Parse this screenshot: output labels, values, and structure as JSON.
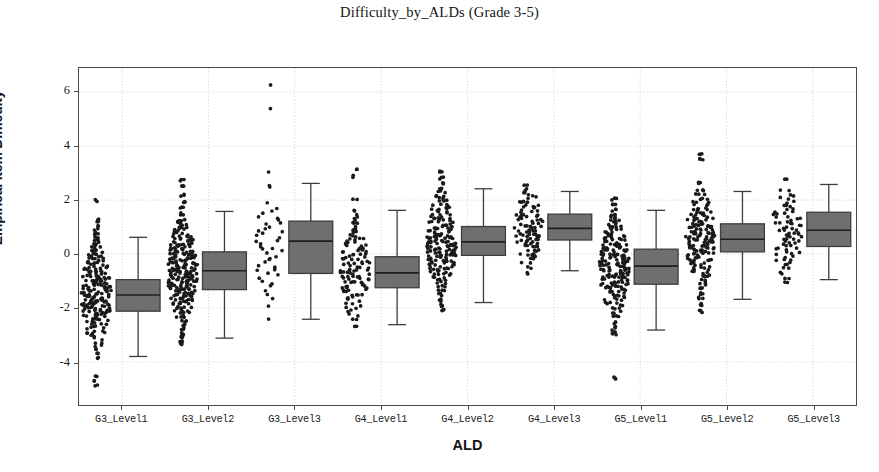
{
  "chart_data": {
    "type": "box",
    "title": "Difficulty_by_ALDs (Grade 3-5)",
    "xlabel": "ALD",
    "ylabel": "Empirical Item Difficulty",
    "categories": [
      "G3_Level1",
      "G3_Level2",
      "G3_Level3",
      "G4_Level1",
      "G4_Level2",
      "G4_Level3",
      "G5_Level1",
      "G5_Level2",
      "G5_Level3"
    ],
    "ylim": [
      -5.6,
      6.9
    ],
    "yticks": [
      -4,
      -2,
      0,
      2,
      4,
      6
    ],
    "ytick_labels": [
      "-4",
      "-2",
      "0",
      "2",
      "4",
      "6"
    ],
    "grid": true,
    "grid_style": "dotted",
    "legend": "none",
    "box_color": "#6f6f6f",
    "line_color": "#3d3d3d",
    "point_color": "#1a1a1a",
    "boxes": [
      {
        "category": "G3_Level1",
        "q1": -2.12,
        "median": -1.52,
        "q3": -0.95,
        "whisker_low": -3.8,
        "whisker_high": 0.62
      },
      {
        "category": "G3_Level2",
        "q1": -1.32,
        "median": -0.62,
        "q3": 0.08,
        "whisker_low": -3.12,
        "whisker_high": 1.58
      },
      {
        "category": "G3_Level3",
        "q1": -0.72,
        "median": 0.48,
        "q3": 1.22,
        "whisker_low": -2.42,
        "whisker_high": 2.62
      },
      {
        "category": "G4_Level1",
        "q1": -1.25,
        "median": -0.7,
        "q3": -0.1,
        "whisker_low": -2.62,
        "whisker_high": 1.62
      },
      {
        "category": "G4_Level2",
        "q1": -0.05,
        "median": 0.45,
        "q3": 1.02,
        "whisker_low": -1.8,
        "whisker_high": 2.42
      },
      {
        "category": "G4_Level3",
        "q1": 0.52,
        "median": 0.95,
        "q3": 1.48,
        "whisker_low": -0.62,
        "whisker_high": 2.32
      },
      {
        "category": "G5_Level1",
        "q1": -1.12,
        "median": -0.45,
        "q3": 0.18,
        "whisker_low": -2.82,
        "whisker_high": 1.62
      },
      {
        "category": "G5_Level2",
        "q1": 0.08,
        "median": 0.55,
        "q3": 1.12,
        "whisker_low": -1.68,
        "whisker_high": 2.32
      },
      {
        "category": "G5_Level3",
        "q1": 0.28,
        "median": 0.88,
        "q3": 1.55,
        "whisker_low": -0.95,
        "whisker_high": 2.58
      }
    ],
    "strips": [
      {
        "category": "G3_Level1",
        "n": 190,
        "center": -1.55,
        "spread": 0.95,
        "min": -4.95,
        "max": 2.0,
        "values": [
          2.0,
          1.28,
          1.18,
          1.05,
          0.92,
          0.78,
          0.7,
          0.62,
          0.55,
          0.48,
          0.4,
          0.35,
          0.3,
          0.22,
          0.15,
          0.1,
          0.05,
          0.0,
          -0.05,
          -0.1,
          -0.15,
          -0.2,
          -0.25,
          -0.3,
          -0.32,
          -0.36,
          -0.4,
          -0.44,
          -0.48,
          -0.52,
          -0.55,
          -0.58,
          -0.62,
          -0.65,
          -0.68,
          -0.72,
          -0.75,
          -0.78,
          -0.82,
          -0.85,
          -0.88,
          -0.92,
          -0.95,
          -0.98,
          -1.0,
          -1.02,
          -1.05,
          -1.08,
          -1.1,
          -1.12,
          -1.15,
          -1.18,
          -1.2,
          -1.22,
          -1.25,
          -1.28,
          -1.3,
          -1.32,
          -1.35,
          -1.38,
          -1.4,
          -1.42,
          -1.45,
          -1.48,
          -1.5,
          -1.52,
          -1.55,
          -1.58,
          -1.6,
          -1.62,
          -1.65,
          -1.68,
          -1.7,
          -1.72,
          -1.75,
          -1.78,
          -1.8,
          -1.82,
          -1.85,
          -1.88,
          -1.9,
          -1.92,
          -1.95,
          -1.98,
          -2.0,
          -2.02,
          -2.05,
          -2.08,
          -2.1,
          -2.12,
          -2.15,
          -2.18,
          -2.2,
          -2.22,
          -2.25,
          -2.28,
          -2.3,
          -2.35,
          -2.4,
          -2.45,
          -2.5,
          -2.55,
          -2.6,
          -2.65,
          -2.7,
          -2.75,
          -2.82,
          -2.9,
          -2.98,
          -3.05,
          -3.15,
          -3.28,
          -3.4,
          -3.55,
          -3.7,
          -3.85,
          -4.55,
          -4.72,
          -4.9
        ]
      },
      {
        "category": "G3_Level2",
        "n": 230,
        "center": -0.65,
        "spread": 0.95,
        "min": -3.35,
        "max": 2.72,
        "values": [
          2.72,
          2.48,
          2.18,
          1.92,
          1.7,
          1.48,
          1.28,
          1.18,
          1.08,
          0.98,
          0.9,
          0.82,
          0.75,
          0.68,
          0.62,
          0.55,
          0.5,
          0.45,
          0.4,
          0.35,
          0.3,
          0.25,
          0.22,
          0.18,
          0.14,
          0.1,
          0.06,
          0.02,
          -0.02,
          -0.06,
          -0.1,
          -0.14,
          -0.18,
          -0.22,
          -0.26,
          -0.3,
          -0.33,
          -0.36,
          -0.4,
          -0.43,
          -0.46,
          -0.5,
          -0.53,
          -0.56,
          -0.6,
          -0.63,
          -0.66,
          -0.7,
          -0.73,
          -0.76,
          -0.8,
          -0.83,
          -0.86,
          -0.9,
          -0.93,
          -0.96,
          -1.0,
          -1.03,
          -1.06,
          -1.1,
          -1.13,
          -1.16,
          -1.2,
          -1.23,
          -1.26,
          -1.3,
          -1.34,
          -1.38,
          -1.42,
          -1.46,
          -1.5,
          -1.55,
          -1.6,
          -1.65,
          -1.7,
          -1.76,
          -1.82,
          -1.88,
          -1.95,
          -2.02,
          -2.1,
          -2.18,
          -2.28,
          -2.38,
          -2.5,
          -2.62,
          -2.78,
          -2.95,
          -3.1,
          -3.22,
          -3.35
        ]
      },
      {
        "category": "G3_Level3",
        "n": 70,
        "center": 0.35,
        "spread": 1.1,
        "min": -2.38,
        "max": 6.32,
        "values": [
          6.32,
          5.38,
          3.0,
          2.58,
          2.45,
          1.88,
          1.72,
          1.6,
          1.5,
          1.42,
          1.35,
          1.28,
          1.2,
          1.12,
          1.05,
          0.98,
          0.9,
          0.82,
          0.75,
          0.68,
          0.6,
          0.52,
          0.45,
          0.38,
          0.3,
          0.22,
          0.15,
          0.08,
          0.0,
          -0.08,
          -0.16,
          -0.24,
          -0.32,
          -0.4,
          -0.48,
          -0.56,
          -0.64,
          -0.72,
          -0.8,
          -0.9,
          -1.0,
          -1.1,
          -1.22,
          -1.35,
          -1.5,
          -1.7,
          -1.92,
          -2.38
        ]
      },
      {
        "category": "G4_Level1",
        "n": 150,
        "center": -0.7,
        "spread": 0.85,
        "min": -2.72,
        "max": 3.18,
        "values": [
          3.18,
          2.88,
          2.02,
          1.58,
          1.42,
          1.3,
          1.2,
          1.1,
          1.0,
          0.92,
          0.84,
          0.76,
          0.68,
          0.6,
          0.54,
          0.48,
          0.42,
          0.36,
          0.3,
          0.24,
          0.18,
          0.12,
          0.06,
          0.0,
          -0.05,
          -0.1,
          -0.15,
          -0.2,
          -0.25,
          -0.3,
          -0.35,
          -0.4,
          -0.45,
          -0.5,
          -0.55,
          -0.6,
          -0.64,
          -0.68,
          -0.72,
          -0.76,
          -0.8,
          -0.84,
          -0.88,
          -0.92,
          -0.96,
          -1.0,
          -1.05,
          -1.1,
          -1.15,
          -1.2,
          -1.25,
          -1.3,
          -1.36,
          -1.42,
          -1.48,
          -1.55,
          -1.62,
          -1.7,
          -1.78,
          -1.88,
          -1.98,
          -2.1,
          -2.25,
          -2.45,
          -2.72
        ]
      },
      {
        "category": "G4_Level2",
        "n": 210,
        "center": 0.42,
        "spread": 0.9,
        "min": -2.05,
        "max": 3.05,
        "values": [
          3.05,
          2.82,
          2.62,
          2.45,
          2.3,
          2.18,
          2.05,
          1.95,
          1.85,
          1.75,
          1.66,
          1.58,
          1.5,
          1.42,
          1.35,
          1.28,
          1.22,
          1.16,
          1.1,
          1.04,
          0.98,
          0.92,
          0.87,
          0.82,
          0.77,
          0.72,
          0.67,
          0.62,
          0.58,
          0.54,
          0.5,
          0.46,
          0.42,
          0.38,
          0.34,
          0.3,
          0.26,
          0.22,
          0.18,
          0.14,
          0.1,
          0.06,
          0.02,
          -0.02,
          -0.06,
          -0.1,
          -0.15,
          -0.2,
          -0.25,
          -0.3,
          -0.35,
          -0.4,
          -0.46,
          -0.52,
          -0.58,
          -0.64,
          -0.7,
          -0.78,
          -0.86,
          -0.95,
          -1.05,
          -1.18,
          -1.32,
          -1.5,
          -1.72,
          -1.9,
          -2.05
        ]
      },
      {
        "category": "G4_Level3",
        "n": 95,
        "center": 1.0,
        "spread": 0.75,
        "min": -0.72,
        "max": 2.55,
        "values": [
          2.55,
          2.4,
          2.28,
          2.18,
          2.08,
          1.98,
          1.9,
          1.82,
          1.75,
          1.68,
          1.62,
          1.56,
          1.5,
          1.44,
          1.38,
          1.32,
          1.27,
          1.22,
          1.17,
          1.12,
          1.07,
          1.02,
          0.98,
          0.94,
          0.9,
          0.86,
          0.82,
          0.78,
          0.74,
          0.7,
          0.66,
          0.62,
          0.58,
          0.54,
          0.5,
          0.45,
          0.4,
          0.35,
          0.3,
          0.24,
          0.18,
          0.12,
          0.05,
          -0.02,
          -0.1,
          -0.2,
          -0.32,
          -0.48,
          -0.72
        ]
      },
      {
        "category": "G5_Level1",
        "n": 200,
        "center": -0.5,
        "spread": 0.9,
        "min": -4.6,
        "max": 2.05,
        "values": [
          2.05,
          1.82,
          1.62,
          1.48,
          1.35,
          1.25,
          1.15,
          1.06,
          0.98,
          0.9,
          0.82,
          0.75,
          0.68,
          0.62,
          0.56,
          0.5,
          0.44,
          0.38,
          0.32,
          0.27,
          0.22,
          0.17,
          0.12,
          0.07,
          0.02,
          -0.02,
          -0.06,
          -0.1,
          -0.14,
          -0.18,
          -0.22,
          -0.26,
          -0.3,
          -0.34,
          -0.38,
          -0.42,
          -0.46,
          -0.5,
          -0.54,
          -0.58,
          -0.62,
          -0.66,
          -0.7,
          -0.74,
          -0.78,
          -0.82,
          -0.86,
          -0.9,
          -0.95,
          -1.0,
          -1.05,
          -1.1,
          -1.15,
          -1.2,
          -1.26,
          -1.32,
          -1.38,
          -1.45,
          -1.52,
          -1.6,
          -1.68,
          -1.78,
          -1.88,
          -2.0,
          -2.15,
          -2.32,
          -2.55,
          -2.72,
          -2.85,
          -3.0,
          -4.6
        ]
      },
      {
        "category": "G5_Level2",
        "n": 205,
        "center": 0.55,
        "spread": 0.88,
        "min": -2.12,
        "max": 3.7,
        "values": [
          3.7,
          3.52,
          2.62,
          2.35,
          2.18,
          2.05,
          1.92,
          1.82,
          1.72,
          1.64,
          1.56,
          1.48,
          1.4,
          1.33,
          1.27,
          1.21,
          1.15,
          1.09,
          1.04,
          0.99,
          0.94,
          0.89,
          0.84,
          0.8,
          0.76,
          0.72,
          0.68,
          0.64,
          0.6,
          0.56,
          0.52,
          0.48,
          0.44,
          0.4,
          0.36,
          0.32,
          0.28,
          0.24,
          0.2,
          0.15,
          0.1,
          0.05,
          0.0,
          -0.06,
          -0.12,
          -0.18,
          -0.25,
          -0.32,
          -0.4,
          -0.48,
          -0.56,
          -0.65,
          -0.75,
          -0.86,
          -0.98,
          -1.12,
          -1.28,
          -1.45,
          -1.65,
          -1.88,
          -2.12
        ]
      },
      {
        "category": "G5_Level3",
        "n": 65,
        "center": 0.85,
        "spread": 0.85,
        "min": -1.05,
        "max": 2.82,
        "values": [
          2.82,
          2.35,
          2.18,
          2.05,
          1.92,
          1.82,
          1.72,
          1.62,
          1.54,
          1.46,
          1.38,
          1.31,
          1.24,
          1.17,
          1.11,
          1.05,
          0.99,
          0.93,
          0.87,
          0.81,
          0.75,
          0.69,
          0.63,
          0.57,
          0.51,
          0.45,
          0.38,
          0.31,
          0.24,
          0.17,
          0.09,
          0.01,
          -0.08,
          -0.18,
          -0.28,
          -0.4,
          -0.55,
          -0.72,
          -0.9,
          -1.05
        ]
      }
    ]
  },
  "axes": {
    "ytick_labels": [
      "6",
      "4",
      "2",
      "0",
      "-2",
      "-4"
    ],
    "xtick_labels": [
      "G3_Level1",
      "G3_Level2",
      "G3_Level3",
      "G4_Level1",
      "G4_Level2",
      "G4_Level3",
      "G5_Level1",
      "G5_Level2",
      "G5_Level3"
    ]
  }
}
